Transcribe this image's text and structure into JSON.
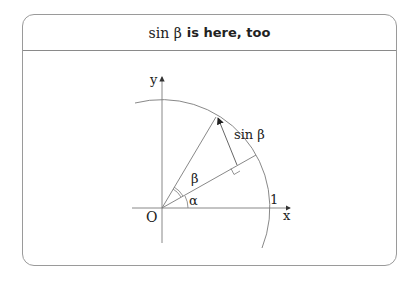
{
  "slide": {
    "title_math": "sin β",
    "title_text": "is here, too"
  },
  "diagram": {
    "labels": {
      "y_axis": "y",
      "x_axis": "x",
      "origin": "O",
      "unit": "1",
      "alpha": "α",
      "beta": "β",
      "sin_beta": "sin β"
    },
    "colors": {
      "line": "#7a7a7a",
      "text": "#222222",
      "frame": "#9a9a9a"
    }
  }
}
